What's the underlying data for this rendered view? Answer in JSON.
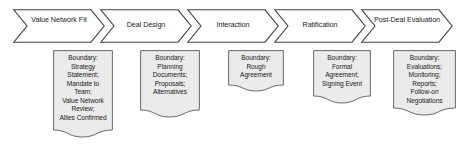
{
  "diagram": {
    "type": "process-flow",
    "colors": {
      "stroke": "#404040",
      "box_fill": "#ebebeb",
      "box_stroke": "#595959",
      "chevron_fill": "#ffffff",
      "text": "#1a1a1a",
      "background": "#ffffff"
    },
    "stages": [
      {
        "id": "value-network-fit",
        "label": "Value\nNetwork Fit",
        "boundary": "Boundary:\nStrategy\nStatement;\nMandate to\nTeam;\nValue Network\nReview;\nAllies Confirmed"
      },
      {
        "id": "deal-design",
        "label": "Deal Design",
        "boundary": "Boundary:\nPlanning\nDocuments;\nProposals;\nAlternatives"
      },
      {
        "id": "interaction",
        "label": "Interaction",
        "boundary": "Boundary:\nRough\nAgreement"
      },
      {
        "id": "ratification",
        "label": "Ratification",
        "boundary": "Boundary:\nFormal\nAgreement;\nSigning Event"
      },
      {
        "id": "post-deal-evaluation",
        "label": "Post-Deal\nEvaluation",
        "boundary": "Boundary:\nEvaluations;\nMonitoring;\nReports;\nFollow-on\nNegotiations"
      }
    ]
  }
}
